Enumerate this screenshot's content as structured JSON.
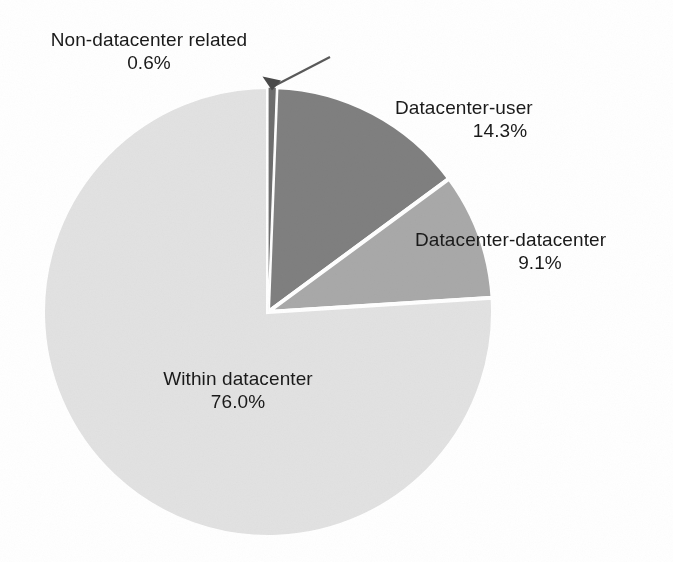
{
  "chart_data": {
    "type": "pie",
    "title": "",
    "subtitle": "",
    "xlabel": "",
    "ylabel": "",
    "legend_position": "none",
    "labels_position": "outside",
    "grid": false,
    "total_percent": 100.0,
    "categories": [
      "Non-datacenter related",
      "Datacenter-user",
      "Datacenter-datacenter",
      "Within datacenter"
    ],
    "values": [
      0.6,
      14.3,
      9.1,
      76.0
    ],
    "value_labels": [
      "0.6%",
      "14.3%",
      "9.1%",
      "76.0%"
    ],
    "colors": [
      "#6e6e6e",
      "#808080",
      "#a9a9a9",
      "#e2e2e2"
    ],
    "slice_separator_color": "#ffffff",
    "background_color": "#ffffff",
    "text_color": "#1a1a1a",
    "start_angle_deg": 0,
    "direction": "clockwise",
    "slices": [
      {
        "name": "Non-datacenter related",
        "percent": 0.6,
        "percent_label": "0.6%",
        "color": "#6e6e6e",
        "callout": "arrow",
        "label_placement": "top-left"
      },
      {
        "name": "Datacenter-user",
        "percent": 14.3,
        "percent_label": "14.3%",
        "color": "#808080",
        "callout": "none",
        "label_placement": "right-upper"
      },
      {
        "name": "Datacenter-datacenter",
        "percent": 9.1,
        "percent_label": "9.1%",
        "color": "#a9a9a9",
        "callout": "none",
        "label_placement": "right-lower"
      },
      {
        "name": "Within datacenter",
        "percent": 76.0,
        "percent_label": "76.0%",
        "color": "#e2e2e2",
        "callout": "none",
        "label_placement": "inside-bottom"
      }
    ]
  },
  "labels": {
    "non_datacenter": {
      "name": "Non-datacenter related",
      "value": "0.6%"
    },
    "datacenter_user": {
      "name": "Datacenter-user",
      "value": "14.3%"
    },
    "datacenter_datacenter": {
      "name": "Datacenter-datacenter",
      "value": "9.1%"
    },
    "within_datacenter": {
      "name": "Within datacenter",
      "value": "76.0%"
    }
  }
}
